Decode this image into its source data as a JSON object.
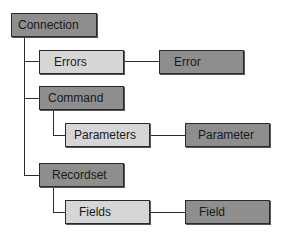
{
  "diagram": {
    "nodes": {
      "connection": {
        "label": "Connection",
        "kind": "object"
      },
      "errors": {
        "label": "Errors",
        "kind": "collection"
      },
      "error": {
        "label": "Error",
        "kind": "object"
      },
      "command": {
        "label": "Command",
        "kind": "object"
      },
      "parameters": {
        "label": "Parameters",
        "kind": "collection"
      },
      "parameter": {
        "label": "Parameter",
        "kind": "object"
      },
      "recordset": {
        "label": "Recordset",
        "kind": "object"
      },
      "fields": {
        "label": "Fields",
        "kind": "collection"
      },
      "field": {
        "label": "Field",
        "kind": "object"
      }
    },
    "edges": [
      [
        "Connection",
        "Errors"
      ],
      [
        "Errors",
        "Error"
      ],
      [
        "Connection",
        "Command"
      ],
      [
        "Command",
        "Parameters"
      ],
      [
        "Parameters",
        "Parameter"
      ],
      [
        "Connection",
        "Recordset"
      ],
      [
        "Recordset",
        "Fields"
      ],
      [
        "Fields",
        "Field"
      ]
    ],
    "colors": {
      "object_fill": "#8e8e8e",
      "collection_fill": "#d6d6d6",
      "line": "#2a2a2a"
    }
  }
}
